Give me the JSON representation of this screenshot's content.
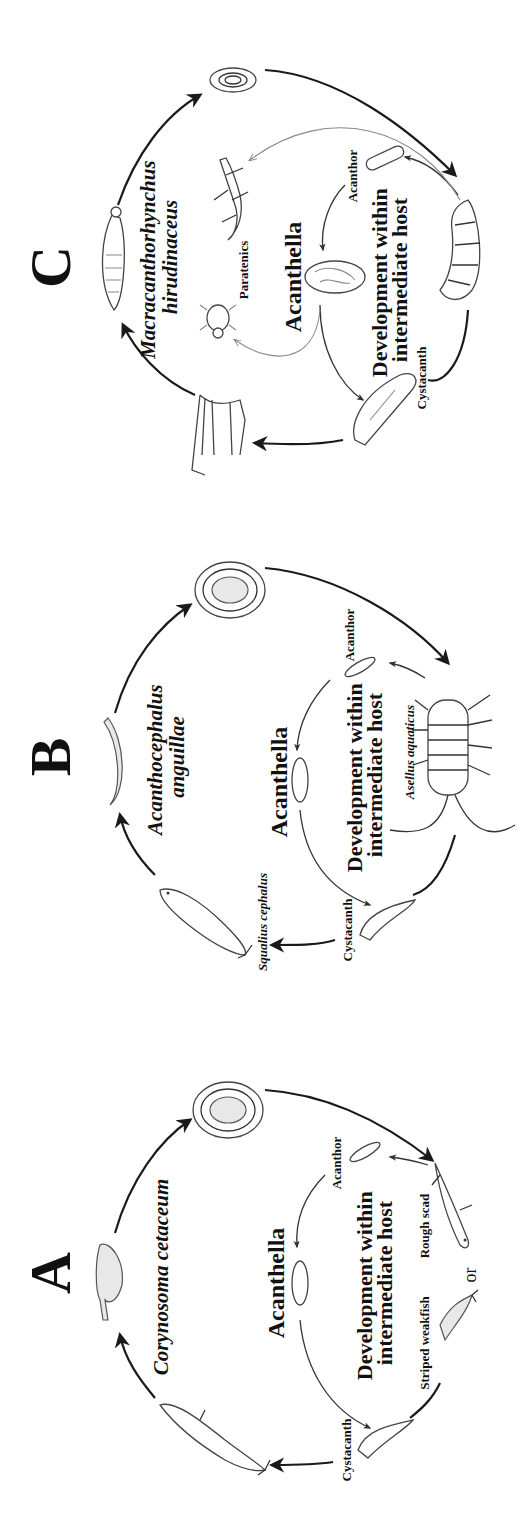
{
  "figure": {
    "orientation": "rotated 90 degrees counterclockwise",
    "panels": [
      {
        "letter": "C",
        "species": [
          "Macracanthorhynchus",
          "hirudinaceus"
        ],
        "stages": {
          "acanthor": "Acanthor",
          "acanthella": "Acanthella",
          "cystacanth": "Cystacanth",
          "paratenics": "Paratenics"
        },
        "development": [
          "Development within",
          "intermediate host"
        ]
      },
      {
        "letter": "B",
        "species": [
          "Acanthocephalus",
          "anguillae"
        ],
        "stages": {
          "acanthor": "Acanthor",
          "acanthella": "Acanthella",
          "cystacanth": "Cystacanth"
        },
        "development": [
          "Development within",
          "intermediate host"
        ],
        "intermediate_host": "Asellus aquaticus",
        "definitive_host": "Squalius cephalus"
      },
      {
        "letter": "A",
        "species": [
          "Corynosoma cetaceum"
        ],
        "stages": {
          "acanthor": "Acanthor",
          "acanthella": "Acanthella",
          "cystacanth": "Cystacanth"
        },
        "development": [
          "Development within",
          "intermediate host"
        ],
        "intermediate_hosts": [
          "Rough scad",
          "Striped weakfish"
        ],
        "connector": "or"
      }
    ]
  }
}
